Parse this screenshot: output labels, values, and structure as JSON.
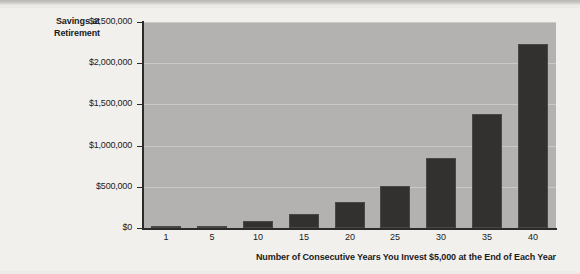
{
  "chart_data": {
    "type": "bar",
    "title": "",
    "ylabel": "Savings at Retirement",
    "xlabel": "Number of Consecutive Years You Invest $5,000 at the End of Each Year",
    "categories": [
      "1",
      "5",
      "10",
      "15",
      "20",
      "25",
      "30",
      "35",
      "40"
    ],
    "values": [
      5000,
      30000,
      80000,
      165000,
      310000,
      510000,
      845000,
      1380000,
      2230000
    ],
    "ylim": [
      0,
      2500000
    ],
    "ytick_labels": [
      "$2,500,000",
      "$2,000,000",
      "$1,500,000",
      "$1,000,000",
      "$500,000",
      "$0"
    ],
    "ytick_values": [
      2500000,
      2000000,
      1500000,
      1000000,
      500000,
      0
    ],
    "grid": true,
    "legend": "none",
    "colors": {
      "bar_fill": "#333130",
      "plot_background": "#b4b2b0",
      "gridline": "#cbc9c7",
      "axis": "#2b2b2b",
      "text": "#1b1b1b",
      "page_background": "#f2f0ed"
    }
  },
  "labels": {
    "y_title_line1": "Savings at",
    "y_title_line2": "Retirement"
  }
}
